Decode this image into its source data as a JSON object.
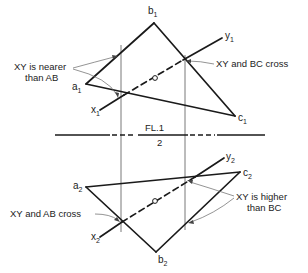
{
  "diagram": {
    "fold_line": {
      "label_top": "FL.1",
      "label_bottom": "2"
    },
    "view1": {
      "points": {
        "a": {
          "name": "a",
          "sub": "1"
        },
        "b": {
          "name": "b",
          "sub": "1"
        },
        "c": {
          "name": "c",
          "sub": "1"
        },
        "x": {
          "name": "x",
          "sub": "1"
        },
        "y": {
          "name": "y",
          "sub": "1"
        }
      },
      "annotations": {
        "nearer_line1": "XY is nearer",
        "nearer_line2": "than AB",
        "cross": "XY and BC cross"
      }
    },
    "view2": {
      "points": {
        "a": {
          "name": "a",
          "sub": "2"
        },
        "b": {
          "name": "b",
          "sub": "2"
        },
        "c": {
          "name": "c",
          "sub": "2"
        },
        "x": {
          "name": "x",
          "sub": "2"
        },
        "y": {
          "name": "y",
          "sub": "2"
        }
      },
      "annotations": {
        "cross": "XY and AB cross",
        "higher_line1": "XY is higher",
        "higher_line2": "than BC"
      }
    },
    "colors": {
      "line": "#1a1a1a",
      "projector": "#555555",
      "leader": "#666666",
      "background": "#ffffff"
    }
  }
}
